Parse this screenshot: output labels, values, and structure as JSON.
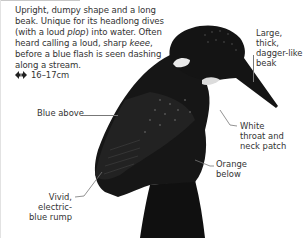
{
  "description": {
    "parts": [
      {
        "text": "Upright, dumpy shape and a long beak. Unique for its headlong dives (with a loud ",
        "italic": false
      },
      {
        "text": "plop",
        "italic": true
      },
      {
        "text": ") into water. Often heard calling a loud, sharp ",
        "italic": false
      },
      {
        "text": "keee",
        "italic": true
      },
      {
        "text": ", before a blue flash is seen dashing along a stream.",
        "italic": false
      }
    ]
  },
  "size": {
    "icon": "double-arrow-icon",
    "value": "16–17cm"
  },
  "labels": {
    "beak": [
      "Large, thick,",
      "dagger-like",
      "beak"
    ],
    "blue_above": [
      "Blue above"
    ],
    "white_throat": [
      "White",
      "throat and",
      "neck patch"
    ],
    "orange_below": [
      "Orange",
      "below"
    ],
    "rump": [
      "Vivid, electric-",
      "blue rump"
    ]
  },
  "colors": {
    "bird": "#141414",
    "text": "#333333",
    "leader": "#777777"
  }
}
